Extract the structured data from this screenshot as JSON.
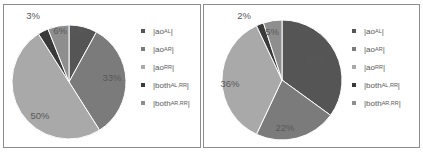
{
  "chart_data": [
    {
      "type": "pie",
      "title": "",
      "categories": [
        "|ao_AL|",
        "|ao_AR|",
        "|ao_RR|",
        "|both_AL,RR|",
        "|both_AR,RR|"
      ],
      "values": [
        8,
        33,
        50,
        3,
        6
      ],
      "labels": [
        "8%",
        "33%",
        "50%",
        "3%",
        "6%"
      ],
      "colors": [
        "#555555",
        "#7b7b7b",
        "#a9a9a9",
        "#3a3a3a",
        "#8e8e8e"
      ],
      "legend_position": "right",
      "start_angle_deg": 0,
      "direction": "clockwise"
    },
    {
      "type": "pie",
      "title": "",
      "categories": [
        "|ao_AL|",
        "|ao_AR|",
        "|ao_RR|",
        "|both_AL,RR|",
        "|both_AR,RR|"
      ],
      "values": [
        35,
        22,
        36,
        2,
        5
      ],
      "labels": [
        "35%",
        "22%",
        "36%",
        "2%",
        "5%"
      ],
      "colors": [
        "#555555",
        "#7b7b7b",
        "#a9a9a9",
        "#3a3a3a",
        "#8e8e8e"
      ],
      "legend_position": "right",
      "start_angle_deg": 0,
      "direction": "clockwise"
    }
  ],
  "legend": [
    {
      "base": "|ao",
      "sub": "AL",
      "end": "|"
    },
    {
      "base": "|ao",
      "sub": "AR",
      "end": "|"
    },
    {
      "base": "|ao",
      "sub": "RR",
      "end": "|"
    },
    {
      "base": "|both",
      "sub": "AL,RR",
      "end": "|"
    },
    {
      "base": "|both",
      "sub": "AR,RR",
      "end": "|"
    }
  ]
}
